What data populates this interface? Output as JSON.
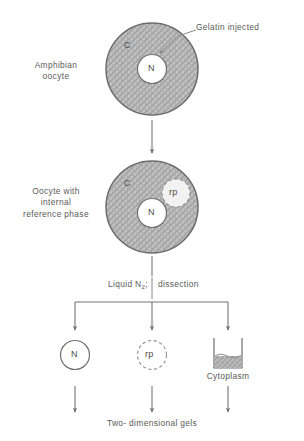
{
  "diagram": {
    "title_text": "",
    "colors": {
      "ink": "#5a5a5a",
      "stipple_fill": "#b9b9b9",
      "cell_border": "#6b6b6b",
      "white": "#ffffff"
    },
    "stage1": {
      "left_label": "Amphibian\noocyte",
      "callout_label": "Gelatin injected",
      "cytoplasm_label": "C",
      "nucleus_label": "N"
    },
    "stage2": {
      "left_label": "Oocyte with\ninternal\nreference phase",
      "cytoplasm_label": "C",
      "nucleus_label": "N",
      "reference_phase_label": "rp"
    },
    "process_step": {
      "text_left": "Liquid N",
      "text_sub": "2",
      "text_semicolon": ";",
      "text_right": "dissection"
    },
    "products": [
      {
        "label": "N",
        "kind": "solid-circle",
        "caption": ""
      },
      {
        "label": "rp",
        "kind": "dashed-circle",
        "caption": ""
      },
      {
        "label": "",
        "kind": "beaker",
        "caption": "Cytoplasm"
      }
    ],
    "footer_label": "Two- dimensional gels"
  }
}
